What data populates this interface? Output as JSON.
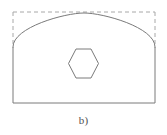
{
  "figure": {
    "caption": "b)",
    "background_color": "#ffffff",
    "solid_stroke_color": "#7a7a7a",
    "dashed_stroke_color": "#a8a8a8",
    "solid_stroke_width": 1,
    "dashed_stroke_width": 1,
    "dash_pattern": "4 3",
    "fill": "none",
    "label_color": "#4f4f4f"
  },
  "chart_data": {
    "type": "diagram",
    "title": "b)",
    "canvas": {
      "width": 167,
      "height": 135
    },
    "shapes": [
      {
        "name": "bounding-box",
        "type": "rectangle",
        "style": "dashed",
        "stroke": "#a8a8a8",
        "x": 13,
        "y": 12,
        "width": 142,
        "height": 91,
        "visible_edges": [
          "top",
          "left-upper",
          "right-upper"
        ]
      },
      {
        "name": "outer-profile",
        "type": "arched-rectangle",
        "style": "solid",
        "stroke": "#7a7a7a",
        "left": 13,
        "right": 155,
        "top": 13,
        "bottom": 103,
        "spring_line_y": 47,
        "arch_apex_x": 84,
        "arch_apex_y": 13,
        "arch_rise": 34,
        "arch_span": 142
      },
      {
        "name": "hexagon-opening",
        "type": "hexagon",
        "style": "solid",
        "stroke": "#7a7a7a",
        "orientation": "flat-top",
        "center_x": 83.5,
        "center_y": 63.5,
        "width": 30,
        "height": 29,
        "vertices": [
          [
            76,
            49
          ],
          [
            91,
            49
          ],
          [
            98.5,
            63.5
          ],
          [
            91,
            78
          ],
          [
            76,
            78
          ],
          [
            68.5,
            63.5
          ]
        ]
      }
    ],
    "annotations": [
      {
        "name": "subfigure-label",
        "text": "b)",
        "x": 84,
        "y": 118
      }
    ]
  }
}
